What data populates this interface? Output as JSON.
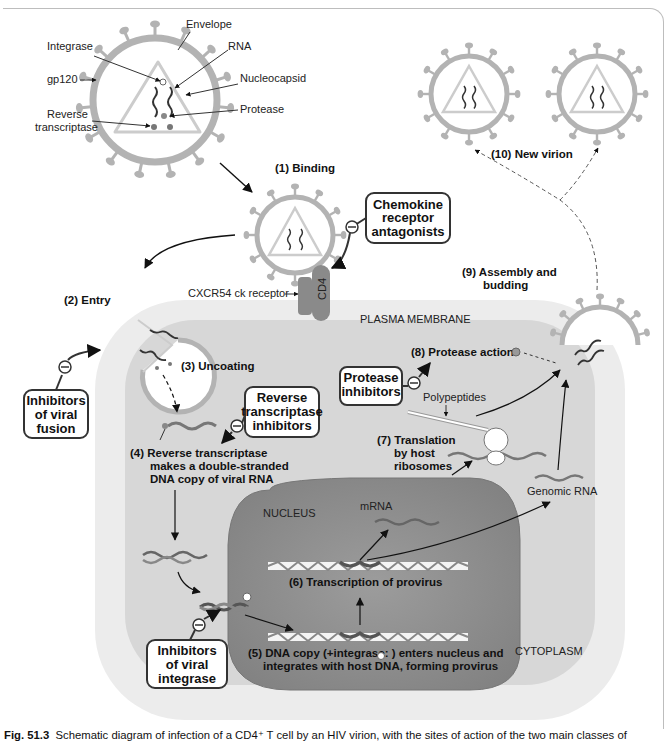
{
  "virion_labels": {
    "envelope": "Envelope",
    "integrase": "Integrase",
    "rna": "RNA",
    "gp120": "gp120",
    "nucleocapsid": "Nucleocapsid",
    "protease": "Protease",
    "reverse_transcriptase_line1": "Reverse",
    "reverse_transcriptase_line2": "transcriptase"
  },
  "steps": {
    "binding": "(1)  Binding",
    "entry": "(2)  Entry",
    "uncoating": "(3)  Uncoating",
    "rt_line1": "(4)  Reverse transcriptase",
    "rt_line2": "makes a double-stranded",
    "rt_line3": "DNA copy of viral RNA",
    "integration_line1": "(5)  DNA copy (+integrase:    ) enters nucleus and",
    "integration_line2": "integrates with host DNA, forming provirus",
    "transcription": "(6)  Transcription of provirus",
    "translation_line1": "(7)  Translation",
    "translation_line2": "by host",
    "translation_line3": "ribosomes",
    "protease_action": "(8)  Protease action",
    "assembly_line1": "(9)  Assembly and",
    "assembly_line2": "budding",
    "new_virion": "(10)  New virion"
  },
  "structures": {
    "cd4": "CD4",
    "cxcr_receptor": "CXCR54 ck receptor",
    "plasma_membrane": "PLASMA MEMBRANE",
    "nucleus": "NUCLEUS",
    "cytoplasm": "CYTOPLASM",
    "mrna": "mRNA",
    "genomic_rna": "Genomic RNA",
    "polypeptides": "Polypeptides"
  },
  "inhibitors": {
    "chemokine": [
      "Chemokine",
      "receptor",
      "antagonists"
    ],
    "fusion": [
      "Inhibitors",
      "of viral",
      "fusion"
    ],
    "reverse_transcriptase": [
      "Reverse",
      "transcriptase",
      "inhibitors"
    ],
    "protease": [
      "Protease",
      "inhibitors"
    ],
    "integrase": [
      "Inhibitors",
      "of viral",
      "integrase"
    ],
    "inhibit_symbol": "−"
  },
  "caption": {
    "fig_number": "Fig. 51.3",
    "text": "Schematic diagram of infection of a CD4⁺ T cell by an HIV virion, with the sites of action of the two main classes of"
  },
  "colors": {
    "virion_gray": "#b3b3b3",
    "cell_outer": "#e9e9e9",
    "cytoplasm": "#d6d6d6",
    "nucleus": "#8e8e8e",
    "receptor": "#8a8a8a"
  }
}
